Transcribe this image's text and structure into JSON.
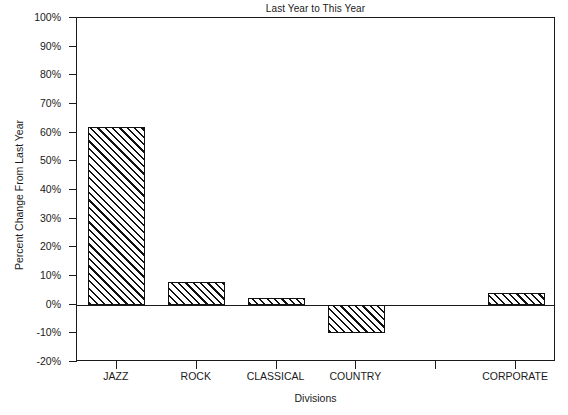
{
  "chart_data": {
    "type": "bar",
    "title": "Last Year to This Year",
    "xlabel": "Divisions",
    "ylabel": "Percent Change From Last Year",
    "categories": [
      "JAZZ",
      "ROCK",
      "CLASSICAL",
      "COUNTRY",
      "",
      "CORPORATE"
    ],
    "values": [
      62,
      8,
      2.5,
      -10,
      null,
      4
    ],
    "ylim": [
      -20,
      100
    ],
    "ytick_values": [
      -20,
      -10,
      0,
      10,
      20,
      30,
      40,
      50,
      60,
      70,
      80,
      90,
      100
    ],
    "ytick_labels": [
      "-20%",
      "-10%",
      "0%",
      "10%",
      "20%",
      "30%",
      "40%",
      "50%",
      "60%",
      "70%",
      "80%",
      "90%",
      "100%"
    ],
    "grid": false,
    "legend": null,
    "bar_fill": "diagonal-hatch",
    "bar_color": "#111111",
    "background": "#ffffff",
    "zero_line": 0
  },
  "axes": {
    "y_ticks": [
      {
        "label": "100%",
        "value": 100
      },
      {
        "label": "90%",
        "value": 90
      },
      {
        "label": "80%",
        "value": 80
      },
      {
        "label": "70%",
        "value": 70
      },
      {
        "label": "60%",
        "value": 60
      },
      {
        "label": "50%",
        "value": 50
      },
      {
        "label": "40%",
        "value": 40
      },
      {
        "label": "30%",
        "value": 30
      },
      {
        "label": "20%",
        "value": 20
      },
      {
        "label": "10%",
        "value": 10
      },
      {
        "label": "0%",
        "value": 0
      },
      {
        "label": "-10%",
        "value": -10
      },
      {
        "label": "-20%",
        "value": -20
      }
    ],
    "x_ticks": [
      {
        "label": "JAZZ",
        "value": 62
      },
      {
        "label": "ROCK",
        "value": 8
      },
      {
        "label": "CLASSICAL",
        "value": 2.5
      },
      {
        "label": "COUNTRY",
        "value": -10
      },
      {
        "label": "",
        "value": null
      },
      {
        "label": "CORPORATE",
        "value": 4
      }
    ]
  }
}
